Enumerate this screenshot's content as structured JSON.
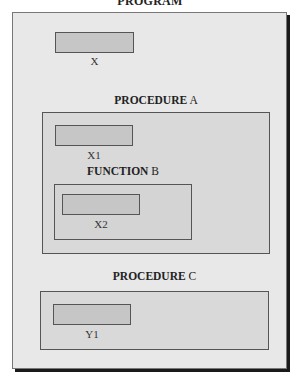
{
  "program": {
    "title": "PROGRAM",
    "variable": {
      "name": "X"
    }
  },
  "procedure_a": {
    "keyword": "PROCEDURE",
    "name": "A",
    "variable": {
      "name": "X1"
    },
    "function_b": {
      "keyword": "FUNCTION",
      "name": "B",
      "variable": {
        "name": "X2"
      }
    }
  },
  "procedure_c": {
    "keyword": "PROCEDURE",
    "name": "C",
    "variable": {
      "name": "Y1"
    }
  },
  "colors": {
    "outer_fill": "#e8e8e8",
    "container_fill": "#d9d9d9",
    "variable_fill": "#c6c6c6",
    "border": "#555555",
    "shadow": "#1a1a1a"
  }
}
